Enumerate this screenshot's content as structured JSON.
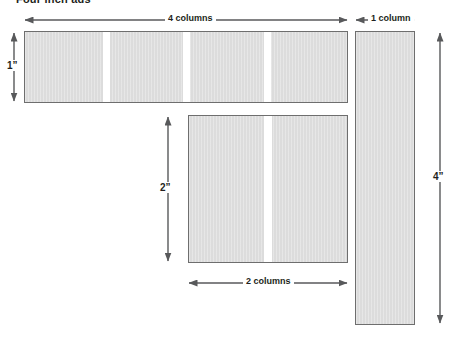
{
  "diagram": {
    "title": "Four inch ads",
    "background_color": "#ffffff",
    "block_fill_color": "#dcdcdc",
    "block_border_color": "#6e6e6e",
    "gutter_color": "#ffffff",
    "arrow_color": "#58595b",
    "text_color": "#231f20"
  },
  "blocks": [
    {
      "id": "four-column",
      "name": "four-column-ad-block",
      "columns": 4,
      "width_label": "4 columns",
      "height_label": "1”"
    },
    {
      "id": "two-column",
      "name": "two-column-ad-block",
      "columns": 2,
      "width_label": "2 columns",
      "height_label": "2”"
    },
    {
      "id": "one-column",
      "name": "one-column-ad-block",
      "columns": 1,
      "width_label": "1 column",
      "height_label": "4”"
    }
  ],
  "labels": {
    "four_columns": "4 columns",
    "one_column": "1 column",
    "two_columns": "2 columns",
    "height_one_inch": "1”",
    "height_two_inch": "2”",
    "height_four_inch": "4”"
  }
}
